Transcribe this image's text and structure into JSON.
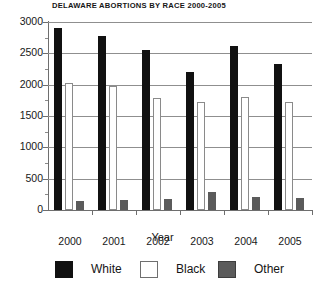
{
  "chart_data": {
    "type": "bar",
    "title": "DELAWARE ABORTIONS BY RACE 2000-2005",
    "xlabel": "Year",
    "ylabel": "",
    "categories": [
      "2000",
      "2001",
      "2002",
      "2003",
      "2004",
      "2005"
    ],
    "ylim": [
      0,
      3000
    ],
    "yticks": [
      0,
      500,
      1000,
      1500,
      2000,
      2500,
      3000
    ],
    "ytick_labels": [
      "0",
      "500",
      "1000",
      "1500",
      "2000",
      "2500",
      "3000"
    ],
    "minor_ticks": true,
    "grid": true,
    "legend_position": "bottom",
    "series": [
      {
        "name": "White",
        "color": "#111111",
        "values": [
          2910,
          2780,
          2560,
          2200,
          2610,
          2330
        ]
      },
      {
        "name": "Black",
        "color": "#ffffff",
        "values": [
          2030,
          1980,
          1790,
          1720,
          1800,
          1730
        ]
      },
      {
        "name": "Other",
        "color": "#5b5b5b",
        "values": [
          150,
          155,
          175,
          290,
          215,
          195
        ]
      }
    ]
  },
  "legend": {
    "items": [
      {
        "label": "White",
        "swatch": "solid-black-swatch"
      },
      {
        "label": "Black",
        "swatch": "hollow-white-swatch"
      },
      {
        "label": "Other",
        "swatch": "solid-gray-swatch"
      }
    ]
  }
}
